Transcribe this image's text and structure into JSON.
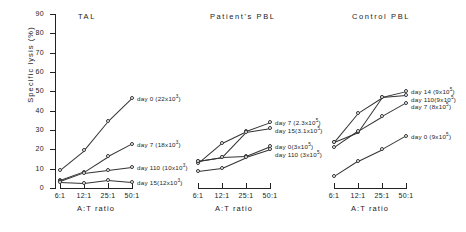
{
  "figure": {
    "ylabel": "Specific lysis (%)",
    "xlabel": "A:T ratio",
    "yticks": [
      "0",
      "10",
      "20",
      "30",
      "40",
      "50",
      "60",
      "70",
      "80",
      "90"
    ],
    "xticks": [
      "6:1",
      "12:1",
      "25:1",
      "50:1"
    ]
  },
  "chart_data": {
    "type": "line",
    "xlabel": "A:T ratio",
    "ylabel": "Specific lysis (%)",
    "x": [
      "6:1",
      "12:1",
      "25:1",
      "50:1"
    ],
    "ylim": [
      0,
      90
    ],
    "ytick_step": 10,
    "grid": false,
    "legend": "inline-right-of-last-point",
    "panels": [
      {
        "name": "TAL",
        "title": "TAL",
        "series": [
          {
            "name": "day 0",
            "label": "day 0 (22x10³)",
            "label_base": "day 0 (22x10",
            "label_exp": "3",
            "label_tail": ")",
            "cells": "22x10^3",
            "values": [
              9.5,
              19.5,
              34.5,
              46.5
            ]
          },
          {
            "name": "day 7",
            "label": "day 7 (18x10³)",
            "label_base": "day 7 (18x10",
            "label_exp": "3",
            "label_tail": ")",
            "cells": "18x10^3",
            "values": [
              4.0,
              8.5,
              16.5,
              23.0
            ]
          },
          {
            "name": "day 110",
            "label": "day 110 (10x10³)",
            "label_base": "day 110 (10x10",
            "label_exp": "3",
            "label_tail": ")",
            "cells": "10x10^3",
            "values": [
              3.5,
              8.0,
              9.5,
              11.0
            ]
          },
          {
            "name": "day 15",
            "label": "day 15(12x10³)",
            "label_base": "day 15(12x10",
            "label_exp": "3",
            "label_tail": ")",
            "cells": "12x10^3",
            "values": [
              3.0,
              2.5,
              4.0,
              3.0
            ]
          }
        ]
      },
      {
        "name": "Patient's PBL",
        "title": "Patient's PBL",
        "series": [
          {
            "name": "day 7",
            "label": "day 7 (2.3x10⁵)",
            "label_base": "day 7 (2.3x10",
            "label_exp": "5",
            "label_tail": ")",
            "cells": "2.3x10^5",
            "values": [
              13.0,
              23.5,
              29.5,
              34.0
            ]
          },
          {
            "name": "day 15",
            "label": "day 15(3.1x10⁵)",
            "label_base": "day 15(3.1x10",
            "label_exp": "5",
            "label_tail": ")",
            "cells": "3.1x10^5",
            "values": [
              14.0,
              16.0,
              29.0,
              31.0
            ]
          },
          {
            "name": "day 0",
            "label": "day 0(3x10⁵)",
            "label_base": "day 0(3x10",
            "label_exp": "5",
            "label_tail": ")",
            "cells": "3x10^5",
            "values": [
              14.0,
              16.0,
              16.5,
              21.5
            ]
          },
          {
            "name": "day 110",
            "label": "day 110 (3x10⁵)",
            "label_base": "day 110 (3x10",
            "label_exp": "5",
            "label_tail": ")",
            "cells": "3x10^5",
            "values": [
              9.0,
              10.5,
              16.0,
              20.0
            ]
          }
        ]
      },
      {
        "name": "Control PBL",
        "title": "Control PBL",
        "series": [
          {
            "name": "day 14",
            "label": "day 14 (9x10⁵)",
            "label_base": "day 14 (9x10",
            "label_exp": "5",
            "label_tail": ")",
            "cells": "9x10^5",
            "values": [
              24.0,
              39.0,
              47.0,
              50.0
            ]
          },
          {
            "name": "day 110",
            "label": "day 110(9x10⁵)",
            "label_base": "day 110(9x10",
            "label_exp": "5",
            "label_tail": ")",
            "cells": "9x10^5",
            "values": [
              24.0,
              29.0,
              47.0,
              48.0
            ]
          },
          {
            "name": "day 7",
            "label": "day 7 (8x10⁵)",
            "label_base": "day 7 (8x10",
            "label_exp": "5",
            "label_tail": ")",
            "cells": "8x10^5",
            "values": [
              21.0,
              29.5,
              37.0,
              44.0
            ]
          },
          {
            "name": "day 0",
            "label": "day 0 (9x10⁵)",
            "label_base": "day 0 (9x10",
            "label_exp": "5",
            "label_tail": ")",
            "cells": "9x10^5",
            "values": [
              6.0,
              14.0,
              20.0,
              27.0
            ]
          }
        ]
      }
    ]
  }
}
